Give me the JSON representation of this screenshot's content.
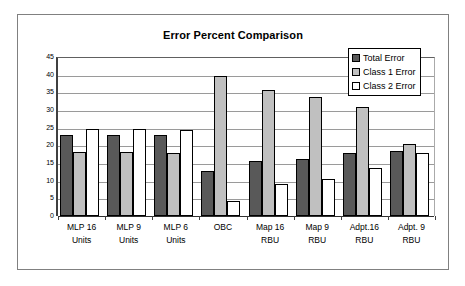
{
  "chart_data": {
    "type": "bar",
    "title": "Error Percent Comparison",
    "xlabel": "",
    "ylabel": "",
    "ylim": [
      0,
      45
    ],
    "ytick_step": 5,
    "yticks": [
      0,
      5,
      10,
      15,
      20,
      25,
      30,
      35,
      40,
      45
    ],
    "grid": true,
    "legend_position": "top-right",
    "categories": [
      "MLP 16 Units",
      "MLP 9 Units",
      "MLP 6 Units",
      "OBC",
      "Map 16 RBU",
      "Map 9 RBU",
      "Adpt.16 RBU",
      "Adpt. 9 RBU"
    ],
    "category_lines": [
      [
        "MLP 16",
        "Units"
      ],
      [
        "MLP 9",
        "Units"
      ],
      [
        "MLP 6",
        "Units"
      ],
      [
        "OBC",
        ""
      ],
      [
        "Map 16",
        "RBU"
      ],
      [
        "Map 9",
        "RBU"
      ],
      [
        "Adpt.16",
        "RBU"
      ],
      [
        "Adpt. 9",
        "RBU"
      ]
    ],
    "series": [
      {
        "name": "Total Error",
        "color": "#595959",
        "values": [
          22.8,
          23.0,
          22.8,
          12.8,
          15.7,
          16.2,
          17.9,
          18.4
        ]
      },
      {
        "name": "Class 1 Error",
        "color": "#c0c0c0",
        "values": [
          18.0,
          18.1,
          17.8,
          39.5,
          35.6,
          33.8,
          30.8,
          20.4
        ]
      },
      {
        "name": "Class 2 Error",
        "color": "#ffffff",
        "values": [
          24.5,
          24.6,
          24.4,
          4.2,
          9.1,
          10.5,
          13.5,
          17.7
        ]
      }
    ]
  },
  "legend": {
    "items": [
      {
        "label": "Total Error",
        "swatch": "dark-gray"
      },
      {
        "label": "Class 1 Error",
        "swatch": "light-gray"
      },
      {
        "label": "Class 2 Error",
        "swatch": "white"
      }
    ]
  }
}
